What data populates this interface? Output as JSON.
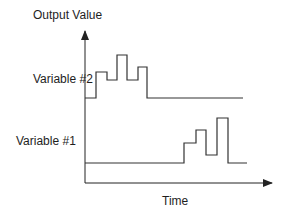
{
  "diagram": {
    "y_axis_label": "Output Value",
    "x_axis_label": "Time",
    "signals": [
      {
        "name": "Variable #2",
        "description": "Pulse train active early in time, then returns to baseline",
        "steps": [
          {
            "x": 85,
            "y": 98
          },
          {
            "x": 96,
            "y": 72
          },
          {
            "x": 107,
            "y": 80
          },
          {
            "x": 117,
            "y": 55
          },
          {
            "x": 127,
            "y": 80
          },
          {
            "x": 138,
            "y": 67
          },
          {
            "x": 147,
            "y": 98
          },
          {
            "x": 243,
            "y": 98
          }
        ]
      },
      {
        "name": "Variable #1",
        "description": "Baseline early, pulse train late in time",
        "steps": [
          {
            "x": 85,
            "y": 163
          },
          {
            "x": 184,
            "y": 143
          },
          {
            "x": 196,
            "y": 130
          },
          {
            "x": 206,
            "y": 155
          },
          {
            "x": 217,
            "y": 118
          },
          {
            "x": 228,
            "y": 163
          },
          {
            "x": 247,
            "y": 163
          }
        ]
      }
    ],
    "colors": {
      "axis": "#222222",
      "signal": "#333333",
      "background": "#ffffff"
    }
  }
}
